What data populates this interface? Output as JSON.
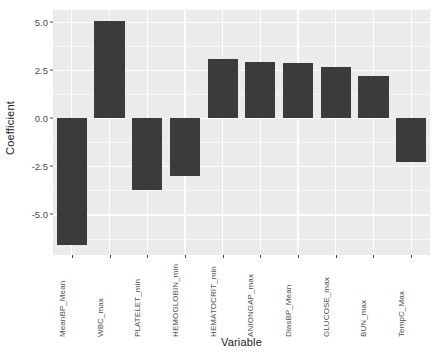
{
  "chart_data": {
    "type": "bar",
    "title": "",
    "xlabel": "Variable",
    "ylabel": "Coefficient",
    "categories": [
      "MeanBP_Mean",
      "WBC_max",
      "PLATELET_min",
      "HEMOGLOBIN_min",
      "HEMATOCRIT_min",
      "ANIONGAP_max",
      "DiasBP_Mean",
      "GLUCOSE_max",
      "BUN_max",
      "TempC_Max"
    ],
    "values": [
      -6.6,
      5.05,
      -3.75,
      -3.0,
      3.05,
      2.9,
      2.85,
      2.65,
      2.2,
      -2.3
    ],
    "ylim": [
      -7.1,
      5.6
    ],
    "yticks": [
      5.0,
      2.5,
      0.0,
      -2.5,
      -5.0
    ],
    "yticklabels": [
      "5.0",
      "2.5",
      "0.0",
      "-2.5",
      "-5.0"
    ],
    "grid": true,
    "legend": "none",
    "bar_color": "#3b3b3b",
    "panel_color": "#ebebeb",
    "gridline_color": "#ffffff"
  }
}
